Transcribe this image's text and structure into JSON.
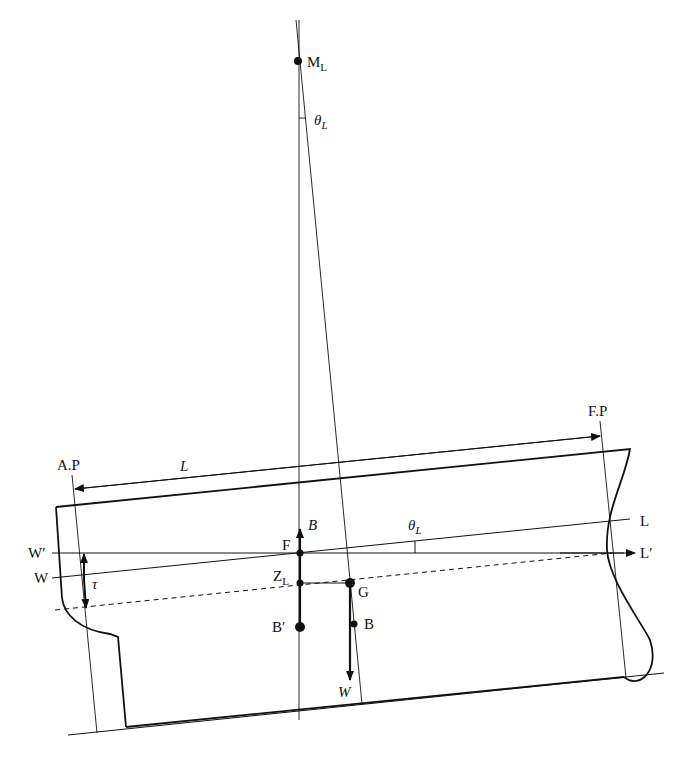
{
  "colors": {
    "line": "#111111",
    "background": "#ffffff"
  },
  "labels": {
    "metacenter": "M",
    "metacenter_sub": "L",
    "theta_top": "θ",
    "theta_top_sub": "L",
    "aft_perpendicular": "A.P",
    "forward_perpendicular": "F.P",
    "length": "L",
    "buoyancy_force": "B",
    "flotation_center": "F",
    "theta_mid": "θ",
    "theta_mid_sub": "L",
    "waterline_new_aft": "W′",
    "waterline_old_aft": "W",
    "waterline_new_fwd": "L′",
    "waterline_old_fwd": "L",
    "trim": "τ",
    "z_point": "Z",
    "z_point_sub": "L",
    "gravity_center": "G",
    "buoyancy_new": "B′",
    "buoyancy_old": "B",
    "weight_force": "W"
  }
}
